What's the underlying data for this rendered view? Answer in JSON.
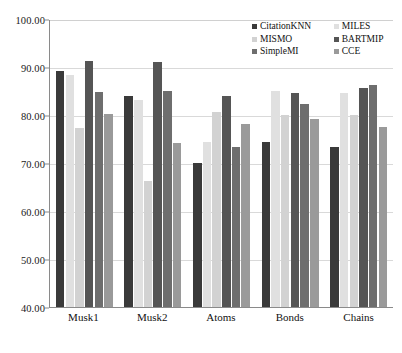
{
  "chart_data": {
    "type": "bar",
    "title": "",
    "xlabel": "",
    "ylabel": "",
    "ylim": [
      40.0,
      100.0
    ],
    "ytick_step": 10.0,
    "ytick_labels": [
      "100.00",
      "90.00",
      "80.00",
      "70.00",
      "60.00",
      "50.00",
      "40.00"
    ],
    "ytick_values": [
      100.0,
      90.0,
      80.0,
      70.0,
      60.0,
      50.0,
      40.0
    ],
    "grid": "horizontal",
    "legend_position": "top-right-inside",
    "categories": [
      "Musk1",
      "Musk2",
      "Atoms",
      "Bonds",
      "Chains"
    ],
    "series": [
      {
        "name": "CitationKNN",
        "color": "#3a3a3a",
        "values": [
          89.2,
          84.0,
          70.1,
          74.3,
          73.3
        ]
      },
      {
        "name": "MILES",
        "color": "#e0e0e0",
        "values": [
          88.3,
          83.1,
          74.3,
          85.1,
          84.5
        ]
      },
      {
        "name": "MISMO",
        "color": "#d2d2d2",
        "values": [
          77.2,
          66.2,
          80.6,
          79.9,
          80.1
        ]
      },
      {
        "name": "BARTMIP",
        "color": "#555555",
        "values": [
          91.2,
          91.0,
          84.0,
          84.5,
          85.6
        ]
      },
      {
        "name": "SimpleMI",
        "color": "#6e6e6e",
        "values": [
          84.7,
          85.1,
          73.3,
          82.3,
          86.2
        ]
      },
      {
        "name": "CCE",
        "color": "#9a9a9a",
        "values": [
          80.3,
          74.1,
          78.2,
          79.2,
          77.6
        ]
      }
    ]
  },
  "legend": {
    "items": [
      {
        "label": "CitationKNN",
        "color": "#3a3a3a"
      },
      {
        "label": "MILES",
        "color": "#e0e0e0"
      },
      {
        "label": "MISMO",
        "color": "#d2d2d2"
      },
      {
        "label": "BARTMIP",
        "color": "#555555"
      },
      {
        "label": "SimpleMI",
        "color": "#6e6e6e"
      },
      {
        "label": "CCE",
        "color": "#9a9a9a"
      }
    ]
  }
}
